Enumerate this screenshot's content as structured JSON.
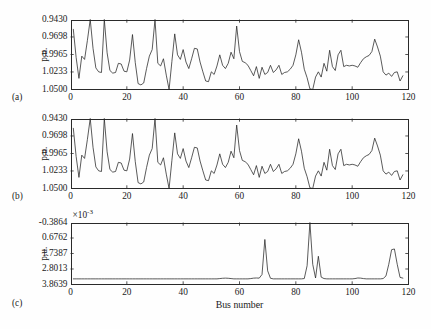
{
  "figure": {
    "width": 431,
    "height": 329,
    "background_color": "#fefefe",
    "line_color": "#242424",
    "axis_color": "#2a2a2a"
  },
  "axis_title": {
    "x": "Bus number"
  },
  "panels": [
    {
      "tag": "(a)",
      "ylabel": "p.u.",
      "yticks": [
        "1.0500",
        "1.0233",
        "0.9965",
        "0.9698",
        "0.9430"
      ],
      "xticks": [
        "0",
        "20",
        "40",
        "60",
        "80",
        "100",
        "120"
      ],
      "exponent": null
    },
    {
      "tag": "(b)",
      "ylabel": "p.u.",
      "yticks": [
        "1.0500",
        "1.0233",
        "0.9965",
        "0.9698",
        "0.9430"
      ],
      "xticks": [
        "0",
        "20",
        "40",
        "60",
        "80",
        "100",
        "120"
      ],
      "exponent": null
    },
    {
      "tag": "(c)",
      "ylabel": "p.u.",
      "yticks": [
        "3.8639",
        "2.8013",
        "1.7387",
        "0.6762",
        "-0.3864"
      ],
      "xticks": [
        "0",
        "20",
        "40",
        "60",
        "80",
        "100",
        "120"
      ],
      "exponent": "×10",
      "exponent_power": "-3"
    }
  ],
  "chart_data": {
    "type": "line",
    "title": "",
    "xlabel": "Bus number",
    "ylabel": "p.u.",
    "xlim": [
      0,
      120
    ],
    "grid": false,
    "legend": null,
    "subplots": [
      {
        "tag": "(a)",
        "ylabel": "p.u.",
        "ylim": [
          0.943,
          1.05
        ],
        "yticks": [
          0.943,
          0.9698,
          0.9965,
          1.0233,
          1.05
        ],
        "xticks": [
          0,
          20,
          40,
          60,
          80,
          100,
          120
        ],
        "x": [
          1,
          2,
          3,
          4,
          5,
          6,
          7,
          8,
          9,
          10,
          11,
          12,
          13,
          14,
          15,
          16,
          17,
          18,
          19,
          20,
          21,
          22,
          23,
          24,
          25,
          26,
          27,
          28,
          29,
          30,
          31,
          32,
          33,
          34,
          35,
          36,
          37,
          38,
          39,
          40,
          41,
          42,
          43,
          44,
          45,
          46,
          47,
          48,
          49,
          50,
          51,
          52,
          53,
          54,
          55,
          56,
          57,
          58,
          59,
          60,
          61,
          62,
          63,
          64,
          65,
          66,
          67,
          68,
          69,
          70,
          71,
          72,
          73,
          74,
          75,
          76,
          77,
          78,
          79,
          80,
          81,
          82,
          83,
          84,
          85,
          86,
          87,
          88,
          89,
          90,
          91,
          92,
          93,
          94,
          95,
          96,
          97,
          98,
          99,
          100,
          101,
          102,
          103,
          104,
          105,
          106,
          107,
          108,
          109,
          110,
          111,
          112,
          113,
          114,
          115,
          116,
          117,
          118
        ],
        "y": [
          1.035,
          0.992,
          0.96,
          0.994,
          0.989,
          1.018,
          1.05,
          1.006,
          0.976,
          0.97,
          0.969,
          1.05,
          0.999,
          0.972,
          0.968,
          0.969,
          0.983,
          0.982,
          0.971,
          0.97,
          0.988,
          1.027,
          0.984,
          0.952,
          0.95,
          0.953,
          0.975,
          0.994,
          1.004,
          1.05,
          0.983,
          0.979,
          0.99,
          0.965,
          0.942,
          0.986,
          1.028,
          0.996,
          0.989,
          1.004,
          0.985,
          0.975,
          0.99,
          1.006,
          1.005,
          0.985,
          0.97,
          0.956,
          0.955,
          0.97,
          0.966,
          0.979,
          0.996,
          0.98,
          0.975,
          0.983,
          1.0,
          0.99,
          1.04,
          1.001,
          0.986,
          0.984,
          0.98,
          0.972,
          0.964,
          0.978,
          0.96,
          0.977,
          0.966,
          0.969,
          0.98,
          0.969,
          0.973,
          0.98,
          0.966,
          0.969,
          0.97,
          0.974,
          0.98,
          0.996,
          1.019,
          1.0,
          0.974,
          0.961,
          0.944,
          0.942,
          0.962,
          0.97,
          0.962,
          0.983,
          0.971,
          1.003,
          0.978,
          0.972,
          0.996,
          1.003,
          0.978,
          0.98,
          0.979,
          0.98,
          0.979,
          0.977,
          0.984,
          0.99,
          0.993,
          0.995,
          1.001,
          1.02,
          1.008,
          0.994,
          0.97,
          0.965,
          0.968,
          0.963,
          0.969,
          0.97,
          0.956,
          0.964
        ]
      },
      {
        "tag": "(b)",
        "ylabel": "p.u.",
        "ylim": [
          0.943,
          1.05
        ],
        "yticks": [
          0.943,
          0.9698,
          0.9965,
          1.0233,
          1.05
        ],
        "xticks": [
          0,
          20,
          40,
          60,
          80,
          100,
          120
        ],
        "x": [
          1,
          2,
          3,
          4,
          5,
          6,
          7,
          8,
          9,
          10,
          11,
          12,
          13,
          14,
          15,
          16,
          17,
          18,
          19,
          20,
          21,
          22,
          23,
          24,
          25,
          26,
          27,
          28,
          29,
          30,
          31,
          32,
          33,
          34,
          35,
          36,
          37,
          38,
          39,
          40,
          41,
          42,
          43,
          44,
          45,
          46,
          47,
          48,
          49,
          50,
          51,
          52,
          53,
          54,
          55,
          56,
          57,
          58,
          59,
          60,
          61,
          62,
          63,
          64,
          65,
          66,
          67,
          68,
          69,
          70,
          71,
          72,
          73,
          74,
          75,
          76,
          77,
          78,
          79,
          80,
          81,
          82,
          83,
          84,
          85,
          86,
          87,
          88,
          89,
          90,
          91,
          92,
          93,
          94,
          95,
          96,
          97,
          98,
          99,
          100,
          101,
          102,
          103,
          104,
          105,
          106,
          107,
          108,
          109,
          110,
          111,
          112,
          113,
          114,
          115,
          116,
          117,
          118
        ],
        "y": [
          1.035,
          0.992,
          0.96,
          0.994,
          0.989,
          1.018,
          1.05,
          1.006,
          0.976,
          0.97,
          0.969,
          1.05,
          0.999,
          0.972,
          0.968,
          0.969,
          0.983,
          0.982,
          0.971,
          0.97,
          0.988,
          1.027,
          0.984,
          0.952,
          0.95,
          0.953,
          0.975,
          0.994,
          1.004,
          1.05,
          0.983,
          0.979,
          0.99,
          0.965,
          0.942,
          0.986,
          1.028,
          0.996,
          0.989,
          1.004,
          0.985,
          0.975,
          0.99,
          1.006,
          1.005,
          0.985,
          0.97,
          0.956,
          0.955,
          0.97,
          0.966,
          0.979,
          0.996,
          0.98,
          0.975,
          0.983,
          1.0,
          0.99,
          1.04,
          1.001,
          0.986,
          0.984,
          0.98,
          0.972,
          0.964,
          0.978,
          0.96,
          0.977,
          0.966,
          0.969,
          0.98,
          0.969,
          0.973,
          0.98,
          0.966,
          0.969,
          0.97,
          0.974,
          0.98,
          0.996,
          1.019,
          1.0,
          0.974,
          0.961,
          0.944,
          0.942,
          0.962,
          0.97,
          0.962,
          0.983,
          0.971,
          1.003,
          0.978,
          0.972,
          0.996,
          1.003,
          0.978,
          0.98,
          0.979,
          0.98,
          0.979,
          0.977,
          0.984,
          0.99,
          0.993,
          0.995,
          1.001,
          1.02,
          1.008,
          0.994,
          0.97,
          0.965,
          0.968,
          0.963,
          0.969,
          0.97,
          0.956,
          0.964
        ]
      },
      {
        "tag": "(c)",
        "ylabel": "p.u.",
        "y_scale_exponent": -3,
        "ylim": [
          -0.3864,
          3.8639
        ],
        "yticks": [
          -0.3864,
          0.6762,
          1.7387,
          2.8013,
          3.8639
        ],
        "xticks": [
          0,
          20,
          40,
          60,
          80,
          100,
          120
        ],
        "x": [
          1,
          2,
          3,
          4,
          5,
          6,
          7,
          8,
          9,
          10,
          11,
          12,
          13,
          14,
          15,
          16,
          17,
          18,
          19,
          20,
          21,
          22,
          23,
          24,
          25,
          26,
          27,
          28,
          29,
          30,
          31,
          32,
          33,
          34,
          35,
          36,
          37,
          38,
          39,
          40,
          41,
          42,
          43,
          44,
          45,
          46,
          47,
          48,
          49,
          50,
          51,
          52,
          53,
          54,
          55,
          56,
          57,
          58,
          59,
          60,
          61,
          62,
          63,
          64,
          65,
          66,
          67,
          68,
          69,
          70,
          71,
          72,
          73,
          74,
          75,
          76,
          77,
          78,
          79,
          80,
          81,
          82,
          83,
          84,
          85,
          86,
          87,
          88,
          89,
          90,
          91,
          92,
          93,
          94,
          95,
          96,
          97,
          98,
          99,
          100,
          101,
          102,
          103,
          104,
          105,
          106,
          107,
          108,
          109,
          110,
          111,
          112,
          113,
          114,
          115,
          116,
          117,
          118
        ],
        "y": [
          0.0,
          0.0,
          0.0,
          0.0,
          0.0,
          0.0,
          0.0,
          0.0,
          0.0,
          0.0,
          0.0,
          0.0,
          0.0,
          0.0,
          0.0,
          0.0,
          0.0,
          0.0,
          0.0,
          0.0,
          0.0,
          0.0,
          0.0,
          0.0,
          0.0,
          0.0,
          0.0,
          0.0,
          0.0,
          0.0,
          0.0,
          0.0,
          0.0,
          0.0,
          0.0,
          0.0,
          0.0,
          0.0,
          0.0,
          0.0,
          0.0,
          0.0,
          0.0,
          0.0,
          0.0,
          0.0,
          0.0,
          0.0,
          0.0,
          0.0,
          0.0,
          0.0,
          0.02,
          0.04,
          0.05,
          0.04,
          0.02,
          0.0,
          0.0,
          0.0,
          0.0,
          0.0,
          0.0,
          0.02,
          0.05,
          0.06,
          0.05,
          0.3,
          2.7,
          0.55,
          0.04,
          0.0,
          0.0,
          0.0,
          0.0,
          0.0,
          0.0,
          0.0,
          0.0,
          0.0,
          0.0,
          0.0,
          0.02,
          0.9,
          3.86,
          1.0,
          0.06,
          1.55,
          0.12,
          0.02,
          0.0,
          0.0,
          0.0,
          0.0,
          0.0,
          0.0,
          0.0,
          0.0,
          0.0,
          0.0,
          0.02,
          0.06,
          0.05,
          0.02,
          0.0,
          0.0,
          0.0,
          0.0,
          0.0,
          0.0,
          0.02,
          0.2,
          1.0,
          2.0,
          2.05,
          1.0,
          0.1,
          0.05
        ]
      }
    ]
  }
}
